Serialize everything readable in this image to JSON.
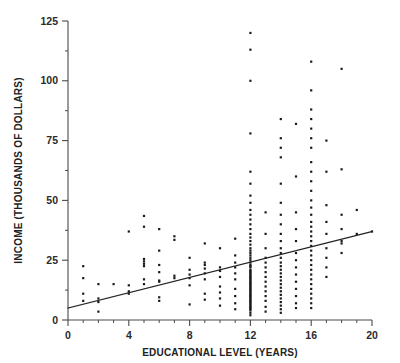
{
  "chart_data": {
    "type": "scatter",
    "title": "",
    "xlabel": "EDUCATIONAL LEVEL (YEARS)",
    "ylabel": "INCOME (THOUSANDS OF DOLLARS)",
    "xlim": [
      0,
      20
    ],
    "ylim": [
      0,
      125
    ],
    "grid": false,
    "legend": null,
    "x_ticks": [
      0,
      4,
      8,
      12,
      16,
      20
    ],
    "x_tick_labels": [
      "0",
      "4",
      "8",
      "12",
      "16",
      "20"
    ],
    "x_minor_tick_step": 1,
    "y_ticks": [
      0,
      25,
      50,
      75,
      100,
      125
    ],
    "y_tick_labels": [
      "0",
      "25",
      "50",
      "75",
      "100",
      "125"
    ],
    "y_minor_tick_step": 12.5,
    "marker": {
      "shape": "square",
      "size_px": 2.2,
      "color": "#1a1a1a"
    },
    "trend_line": {
      "type": "linear-regression",
      "color": "#232323",
      "intercept": 5.0,
      "slope": 1.6,
      "x_start": 0,
      "y_start": 5.0,
      "x_end": 20,
      "y_end": 37.0
    },
    "series": [
      {
        "name": "observations",
        "points": [
          [
            1,
            22.5
          ],
          [
            1,
            17.5
          ],
          [
            1,
            11.0
          ],
          [
            1,
            8.0
          ],
          [
            2,
            15.0
          ],
          [
            2,
            9.0
          ],
          [
            2,
            7.5
          ],
          [
            2,
            3.5
          ],
          [
            3,
            15.0
          ],
          [
            4,
            37.0
          ],
          [
            4,
            14.5
          ],
          [
            4,
            12.0
          ],
          [
            4,
            11.0
          ],
          [
            5,
            43.5
          ],
          [
            5,
            39.0
          ],
          [
            5,
            25.5
          ],
          [
            5,
            24.5
          ],
          [
            5,
            23.5
          ],
          [
            5,
            22.5
          ],
          [
            5,
            17.0
          ],
          [
            5,
            15.0
          ],
          [
            6,
            38.0
          ],
          [
            6,
            29.0
          ],
          [
            6,
            23.0
          ],
          [
            6,
            20.0
          ],
          [
            6,
            16.5
          ],
          [
            6,
            16.0
          ],
          [
            6,
            9.5
          ],
          [
            6,
            8.0
          ],
          [
            7,
            35.0
          ],
          [
            7,
            33.5
          ],
          [
            7,
            18.5
          ],
          [
            7,
            17.5
          ],
          [
            8,
            26.0
          ],
          [
            8,
            21.0
          ],
          [
            8,
            19.0
          ],
          [
            8,
            17.5
          ],
          [
            8,
            14.5
          ],
          [
            8,
            6.5
          ],
          [
            9,
            32.0
          ],
          [
            9,
            24.0
          ],
          [
            9,
            23.0
          ],
          [
            9,
            21.5
          ],
          [
            9,
            19.5
          ],
          [
            9,
            17.0
          ],
          [
            9,
            11.0
          ],
          [
            9,
            8.5
          ],
          [
            10,
            30.0
          ],
          [
            10,
            22.0
          ],
          [
            10,
            20.5
          ],
          [
            10,
            18.0
          ],
          [
            10,
            14.0
          ],
          [
            10,
            11.5
          ],
          [
            10,
            9.0
          ],
          [
            10,
            6.0
          ],
          [
            11,
            34.0
          ],
          [
            11,
            27.0
          ],
          [
            11,
            24.0
          ],
          [
            11,
            22.0
          ],
          [
            11,
            19.5
          ],
          [
            11,
            17.0
          ],
          [
            11,
            13.0
          ],
          [
            11,
            10.0
          ],
          [
            11,
            7.0
          ],
          [
            11,
            4.5
          ],
          [
            12,
            120.0
          ],
          [
            12,
            113.0
          ],
          [
            12,
            100.0
          ],
          [
            12,
            78.0
          ],
          [
            12,
            62.0
          ],
          [
            12,
            57.0
          ],
          [
            12,
            52.0
          ],
          [
            12,
            49.0
          ],
          [
            12,
            46.0
          ],
          [
            12,
            44.0
          ],
          [
            12,
            42.0
          ],
          [
            12,
            40.0
          ],
          [
            12,
            38.0
          ],
          [
            12,
            36.0
          ],
          [
            12,
            34.5
          ],
          [
            12,
            33.0
          ],
          [
            12,
            31.5
          ],
          [
            12,
            30.0
          ],
          [
            12,
            29.0
          ],
          [
            12,
            28.0
          ],
          [
            12,
            27.0
          ],
          [
            12,
            26.0
          ],
          [
            12,
            25.0
          ],
          [
            12,
            24.0
          ],
          [
            12,
            23.0
          ],
          [
            12,
            22.5
          ],
          [
            12,
            22.0
          ],
          [
            12,
            21.0
          ],
          [
            12,
            20.5
          ],
          [
            12,
            20.0
          ],
          [
            12,
            19.5
          ],
          [
            12,
            19.0
          ],
          [
            12,
            18.5
          ],
          [
            12,
            18.0
          ],
          [
            12,
            17.5
          ],
          [
            12,
            17.0
          ],
          [
            12,
            16.5
          ],
          [
            12,
            16.0
          ],
          [
            12,
            15.5
          ],
          [
            12,
            15.0
          ],
          [
            12,
            14.5
          ],
          [
            12,
            14.0
          ],
          [
            12,
            13.5
          ],
          [
            12,
            13.0
          ],
          [
            12,
            12.5
          ],
          [
            12,
            12.0
          ],
          [
            12,
            11.5
          ],
          [
            12,
            11.0
          ],
          [
            12,
            10.5
          ],
          [
            12,
            10.0
          ],
          [
            12,
            9.5
          ],
          [
            12,
            9.0
          ],
          [
            12,
            8.5
          ],
          [
            12,
            8.0
          ],
          [
            12,
            7.5
          ],
          [
            12,
            7.0
          ],
          [
            12,
            6.5
          ],
          [
            12,
            6.0
          ],
          [
            12,
            5.5
          ],
          [
            12,
            5.0
          ],
          [
            12,
            4.5
          ],
          [
            12,
            4.0
          ],
          [
            12,
            3.0
          ],
          [
            12,
            2.0
          ],
          [
            13,
            45.0
          ],
          [
            13,
            36.0
          ],
          [
            13,
            30.0
          ],
          [
            13,
            26.0
          ],
          [
            13,
            24.0
          ],
          [
            13,
            22.0
          ],
          [
            13,
            20.0
          ],
          [
            13,
            18.0
          ],
          [
            13,
            16.0
          ],
          [
            13,
            14.0
          ],
          [
            13,
            12.0
          ],
          [
            13,
            10.0
          ],
          [
            13,
            8.0
          ],
          [
            13,
            5.5
          ],
          [
            13,
            3.5
          ],
          [
            14,
            84.0
          ],
          [
            14,
            76.0
          ],
          [
            14,
            72.0
          ],
          [
            14,
            68.0
          ],
          [
            14,
            57.0
          ],
          [
            14,
            49.0
          ],
          [
            14,
            44.0
          ],
          [
            14,
            40.0
          ],
          [
            14,
            36.0
          ],
          [
            14,
            33.0
          ],
          [
            14,
            30.0
          ],
          [
            14,
            28.0
          ],
          [
            14,
            26.0
          ],
          [
            14,
            24.0
          ],
          [
            14,
            22.5
          ],
          [
            14,
            21.0
          ],
          [
            14,
            19.5
          ],
          [
            14,
            18.0
          ],
          [
            14,
            16.5
          ],
          [
            14,
            15.0
          ],
          [
            14,
            13.5
          ],
          [
            14,
            12.0
          ],
          [
            14,
            10.5
          ],
          [
            14,
            9.0
          ],
          [
            14,
            7.5
          ],
          [
            14,
            6.0
          ],
          [
            14,
            4.5
          ],
          [
            14,
            3.0
          ],
          [
            15,
            82.0
          ],
          [
            15,
            60.0
          ],
          [
            15,
            45.0
          ],
          [
            15,
            38.0
          ],
          [
            15,
            33.0
          ],
          [
            15,
            28.0
          ],
          [
            15,
            25.0
          ],
          [
            15,
            22.0
          ],
          [
            15,
            19.0
          ],
          [
            15,
            16.0
          ],
          [
            15,
            13.0
          ],
          [
            15,
            10.0
          ],
          [
            15,
            7.0
          ],
          [
            15,
            5.0
          ],
          [
            16,
            108.0
          ],
          [
            16,
            96.0
          ],
          [
            16,
            88.0
          ],
          [
            16,
            84.0
          ],
          [
            16,
            80.0
          ],
          [
            16,
            76.0
          ],
          [
            16,
            72.0
          ],
          [
            16,
            66.0
          ],
          [
            16,
            62.0
          ],
          [
            16,
            58.0
          ],
          [
            16,
            54.0
          ],
          [
            16,
            50.0
          ],
          [
            16,
            47.0
          ],
          [
            16,
            44.0
          ],
          [
            16,
            41.0
          ],
          [
            16,
            39.0
          ],
          [
            16,
            37.0
          ],
          [
            16,
            35.0
          ],
          [
            16,
            33.0
          ],
          [
            16,
            31.0
          ],
          [
            16,
            29.0
          ],
          [
            16,
            27.0
          ],
          [
            16,
            25.0
          ],
          [
            16,
            23.0
          ],
          [
            16,
            21.0
          ],
          [
            16,
            19.0
          ],
          [
            16,
            17.0
          ],
          [
            16,
            15.0
          ],
          [
            16,
            13.0
          ],
          [
            16,
            11.0
          ],
          [
            16,
            9.0
          ],
          [
            16,
            7.0
          ],
          [
            16,
            5.0
          ],
          [
            17,
            75.0
          ],
          [
            17,
            62.0
          ],
          [
            17,
            48.0
          ],
          [
            17,
            41.0
          ],
          [
            17,
            36.0
          ],
          [
            17,
            30.0
          ],
          [
            17,
            26.0
          ],
          [
            17,
            22.0
          ],
          [
            17,
            18.0
          ],
          [
            18,
            105.0
          ],
          [
            18,
            63.0
          ],
          [
            18,
            44.0
          ],
          [
            18,
            38.0
          ],
          [
            18,
            33.0
          ],
          [
            18,
            32.0
          ],
          [
            18,
            28.0
          ],
          [
            19,
            46.0
          ],
          [
            19,
            36.0
          ],
          [
            20,
            37.0
          ]
        ]
      }
    ]
  },
  "axis_titles": {
    "x": "EDUCATIONAL LEVEL (YEARS)",
    "y": "INCOME (THOUSANDS OF DOLLARS)"
  }
}
